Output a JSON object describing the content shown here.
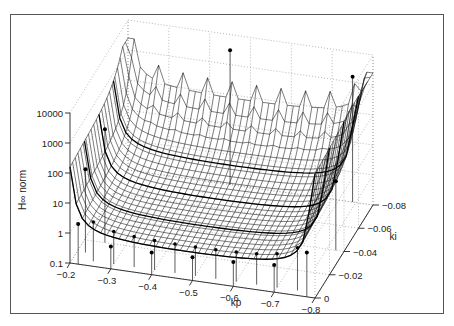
{
  "chart_data": {
    "type": "surface",
    "title": "",
    "xlabel": "kp",
    "ylabel": "ki",
    "zlabel": "H∞ norm",
    "zscale": "log",
    "x_ticks": [
      "-0.2",
      "-0.3",
      "-0.4",
      "-0.5",
      "-0.6",
      "-0.7",
      "-0.8"
    ],
    "y_ticks": [
      "0",
      "-0.02",
      "-0.04",
      "-0.06",
      "-0.08"
    ],
    "z_ticks": [
      "0.1",
      "1",
      "10",
      "100",
      "1000",
      "10000"
    ],
    "xlim": [
      -0.2,
      -0.8
    ],
    "ylim": [
      0,
      -0.08
    ],
    "zlim": [
      0.1,
      10000
    ],
    "grid": "dotted",
    "sample_points": [
      {
        "kp": -0.22,
        "ki": 0.0,
        "z": 2.2
      },
      {
        "kp": -0.22,
        "ki": -0.01,
        "z": 60
      },
      {
        "kp": -0.25,
        "ki": -0.02,
        "z": 600
      },
      {
        "kp": -0.3,
        "ki": 0.0,
        "z": 0.55
      },
      {
        "kp": -0.4,
        "ki": 0.0,
        "z": 0.55
      },
      {
        "kp": -0.5,
        "ki": 0.0,
        "z": 0.6
      },
      {
        "kp": -0.6,
        "ki": 0.0,
        "z": 0.65
      },
      {
        "kp": -0.7,
        "ki": 0.0,
        "z": 0.8
      },
      {
        "kp": -0.78,
        "ki": 0.0,
        "z": 3
      },
      {
        "kp": -0.78,
        "ki": -0.04,
        "z": 20
      },
      {
        "kp": -0.75,
        "ki": -0.08,
        "z": 1500
      },
      {
        "kp": -0.45,
        "ki": -0.08,
        "z": 3000
      }
    ]
  },
  "axes": {
    "z_axis_title": "H∞ norm",
    "x_axis_title": "kp",
    "y_axis_title": "ki"
  }
}
